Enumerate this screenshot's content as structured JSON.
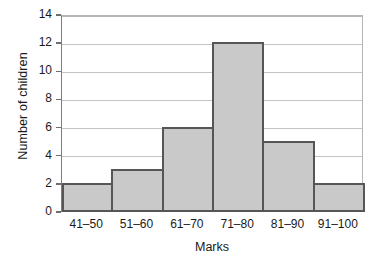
{
  "chart_data": {
    "type": "bar",
    "title": "",
    "subtitle": "",
    "xlabel": "Marks",
    "ylabel": "Number of children",
    "categories": [
      "41–50",
      "51–60",
      "61–70",
      "71–80",
      "81–90",
      "91–100"
    ],
    "values": [
      2,
      3,
      6,
      12,
      5,
      2
    ],
    "series": [
      {
        "name": "Number of children",
        "values": [
          2,
          3,
          6,
          12,
          5,
          2
        ]
      }
    ],
    "ylim": [
      0,
      14
    ],
    "yticks": [
      0,
      2,
      4,
      6,
      8,
      10,
      12,
      14
    ],
    "ytick_labels": [
      "0",
      "2",
      "4",
      "6",
      "8",
      "10",
      "12",
      "14"
    ],
    "xlim": [
      0,
      6
    ],
    "grid": "horizontal",
    "legend": "none",
    "bar_gap": 0,
    "annotations": [],
    "colors": {
      "bar_fill": "#c9c9c9",
      "bar_edge": "#565656",
      "gridline": "#c4c4c4",
      "axis": "#6e6e6e",
      "text": "#1a1a1a",
      "background": "#ffffff"
    }
  }
}
